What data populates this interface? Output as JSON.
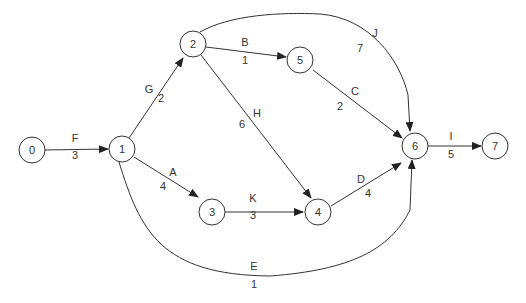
{
  "diagram": {
    "type": "activity-on-arrow network",
    "nodes": [
      {
        "id": "0",
        "label": "0",
        "x": 32,
        "y": 150
      },
      {
        "id": "1",
        "label": "1",
        "x": 122,
        "y": 149
      },
      {
        "id": "2",
        "label": "2",
        "x": 193,
        "y": 44
      },
      {
        "id": "3",
        "label": "3",
        "x": 212,
        "y": 212
      },
      {
        "id": "4",
        "label": "4",
        "x": 318,
        "y": 212
      },
      {
        "id": "5",
        "label": "5",
        "x": 300,
        "y": 60
      },
      {
        "id": "6",
        "label": "6",
        "x": 415,
        "y": 146
      },
      {
        "id": "7",
        "label": "7",
        "x": 495,
        "y": 146
      }
    ],
    "edges": [
      {
        "from": "0",
        "to": "1",
        "activity": "F",
        "duration": "3"
      },
      {
        "from": "1",
        "to": "2",
        "activity": "G",
        "duration": "2"
      },
      {
        "from": "1",
        "to": "3",
        "activity": "A",
        "duration": "4"
      },
      {
        "from": "1",
        "to": "6",
        "activity": "E",
        "duration": "1"
      },
      {
        "from": "2",
        "to": "5",
        "activity": "B",
        "duration": "1"
      },
      {
        "from": "2",
        "to": "4",
        "activity": "H",
        "duration": "6"
      },
      {
        "from": "2",
        "to": "6",
        "activity": "J",
        "duration": "7"
      },
      {
        "from": "5",
        "to": "6",
        "activity": "C",
        "duration": "2"
      },
      {
        "from": "3",
        "to": "4",
        "activity": "K",
        "duration": "3"
      },
      {
        "from": "4",
        "to": "6",
        "activity": "D",
        "duration": "4"
      },
      {
        "from": "6",
        "to": "7",
        "activity": "I",
        "duration": "5"
      }
    ]
  }
}
